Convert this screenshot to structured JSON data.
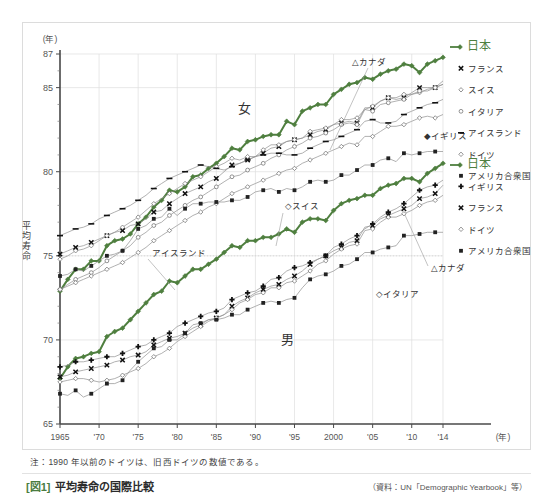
{
  "top_cut_text": "",
  "figure": {
    "caption_tag": "[図1]",
    "caption_title": "平均寿命の国際比較",
    "source": "（資料：UN「Demographic Yearbook」等）",
    "note": "注：1990 年以前のドイツは、旧西ドイツの数値である。"
  },
  "colors": {
    "japan_green": "#4f7f3f",
    "line_gray": "#8a8a8a",
    "axis": "#555555",
    "grid": "#dedede"
  },
  "chart_data": {
    "type": "line",
    "title": "平均寿命の国際比較",
    "xlabel": "(年)",
    "ylabel": "平均寿命",
    "yunit": "(年)",
    "xlim": [
      1965,
      2014
    ],
    "ylim": [
      65,
      87
    ],
    "yticks": [
      65,
      70,
      75,
      80,
      85,
      87
    ],
    "ytick_labels": [
      "65",
      "70",
      "75",
      "80",
      "85",
      "87"
    ],
    "xticks": [
      1965,
      1970,
      1975,
      1980,
      1985,
      1990,
      1995,
      2000,
      2005,
      2010,
      2014
    ],
    "xtick_labels": [
      "1965",
      "'70",
      "'75",
      "'80",
      "'85",
      "'90",
      "'95",
      "2000",
      "'05",
      "'10",
      "'14"
    ],
    "grid": true,
    "legend_position": "right",
    "group_labels": {
      "female": "女",
      "male": "男"
    },
    "inline_annotations": [
      {
        "text": "△カナダ",
        "x": 1994,
        "y": 86.2,
        "group": "female"
      },
      {
        "text": "◇スイス",
        "x": 1989,
        "y": 80.6,
        "group": "female"
      },
      {
        "text": "アイスランド",
        "x": 1977,
        "y": 77.0,
        "group": "female"
      },
      {
        "text": "◆イギリス",
        "x": 2008,
        "y": 81.6,
        "group": "male"
      },
      {
        "text": "△カナダ",
        "x": 2009,
        "y": 74.2,
        "group": "male"
      },
      {
        "text": "◇イタリア",
        "x": 2003,
        "y": 72.9,
        "group": "male"
      }
    ],
    "legend_female": [
      {
        "label": "日本",
        "marker": "diamond",
        "color": "#4f7f3f",
        "emphasis": true
      },
      {
        "label": "フランス",
        "marker": "cross-bold",
        "color": "#222222"
      },
      {
        "label": "スイス",
        "marker": "diamond-open-small",
        "color": "#555555"
      },
      {
        "label": "イタリア",
        "marker": "circle-open",
        "color": "#555555"
      },
      {
        "label": "アイスランド",
        "marker": "dash",
        "color": "#222222"
      },
      {
        "label": "ドイツ",
        "marker": "diamond-open",
        "color": "#555555"
      },
      {
        "label": "アメリカ合衆国",
        "marker": "square",
        "color": "#222222"
      }
    ],
    "legend_male": [
      {
        "label": "日本",
        "marker": "diamond",
        "color": "#4f7f3f",
        "emphasis": true
      },
      {
        "label": "イギリス",
        "marker": "plus-bold",
        "color": "#222222"
      },
      {
        "label": "フランス",
        "marker": "cross-bold",
        "color": "#222222"
      },
      {
        "label": "ドイツ",
        "marker": "diamond-open",
        "color": "#555555"
      },
      {
        "label": "アメリカ合衆国",
        "marker": "square",
        "color": "#222222"
      }
    ],
    "x": [
      1965,
      1966,
      1967,
      1968,
      1969,
      1970,
      1971,
      1972,
      1973,
      1974,
      1975,
      1976,
      1977,
      1978,
      1979,
      1980,
      1981,
      1982,
      1983,
      1984,
      1985,
      1986,
      1987,
      1988,
      1989,
      1990,
      1991,
      1992,
      1993,
      1994,
      1995,
      1996,
      1997,
      1998,
      1999,
      2000,
      2001,
      2002,
      2003,
      2004,
      2005,
      2006,
      2007,
      2008,
      2009,
      2010,
      2011,
      2012,
      2013,
      2014
    ],
    "series": [
      {
        "name": "日本",
        "group": "female",
        "color": "#4f7f3f",
        "values": [
          72.9,
          73.6,
          74.2,
          74.2,
          74.7,
          74.7,
          75.6,
          75.9,
          76.0,
          76.3,
          76.9,
          77.3,
          77.9,
          78.3,
          78.9,
          78.8,
          79.1,
          79.7,
          79.8,
          80.2,
          80.5,
          80.9,
          81.4,
          81.3,
          81.8,
          81.9,
          82.1,
          82.2,
          82.2,
          83.0,
          82.8,
          83.6,
          83.8,
          84.0,
          84.0,
          84.6,
          84.9,
          85.2,
          85.3,
          85.6,
          85.5,
          85.8,
          86.0,
          86.1,
          86.4,
          86.3,
          85.9,
          86.4,
          86.6,
          86.8
        ]
      },
      {
        "name": "フランス",
        "group": "female",
        "color": "#222222",
        "values": [
          75.1,
          75.3,
          75.5,
          75.6,
          75.8,
          76.0,
          76.2,
          76.4,
          76.5,
          76.8,
          76.9,
          77.2,
          77.6,
          77.7,
          78.1,
          78.4,
          78.7,
          78.9,
          79.1,
          79.4,
          79.6,
          80.0,
          80.4,
          80.5,
          80.7,
          80.9,
          81.1,
          81.4,
          81.5,
          81.8,
          81.9,
          82.0,
          82.2,
          82.4,
          82.5,
          82.8,
          82.9,
          83.0,
          82.9,
          83.8,
          83.8,
          84.2,
          84.4,
          84.3,
          84.4,
          84.7,
          85.0,
          85.0,
          85.0,
          85.4
        ]
      },
      {
        "name": "スイス",
        "group": "female",
        "color": "#555555",
        "values": [
          74.8,
          75.0,
          75.3,
          75.4,
          75.6,
          75.9,
          76.2,
          76.4,
          76.7,
          77.0,
          77.3,
          77.7,
          78.1,
          78.4,
          78.7,
          79.0,
          79.3,
          79.5,
          79.7,
          80.0,
          80.3,
          80.5,
          80.8,
          80.7,
          80.9,
          80.9,
          81.3,
          81.6,
          81.6,
          81.8,
          81.9,
          82.0,
          82.4,
          82.5,
          82.6,
          82.8,
          83.1,
          83.1,
          83.2,
          83.7,
          83.9,
          84.2,
          84.4,
          84.4,
          84.6,
          84.6,
          84.7,
          84.9,
          85.0,
          85.2
        ]
      },
      {
        "name": "イタリア",
        "group": "female",
        "color": "#555555",
        "values": [
          73.0,
          73.3,
          73.6,
          73.8,
          74.0,
          74.3,
          74.7,
          75.0,
          75.3,
          75.6,
          76.1,
          76.4,
          76.8,
          77.0,
          77.4,
          77.7,
          78.0,
          78.3,
          78.5,
          78.8,
          79.1,
          79.4,
          79.7,
          79.8,
          80.1,
          80.3,
          80.5,
          80.8,
          81.0,
          81.3,
          81.5,
          81.7,
          82.0,
          82.1,
          82.3,
          82.5,
          82.8,
          82.9,
          82.8,
          83.7,
          83.6,
          84.0,
          84.1,
          84.2,
          84.3,
          84.6,
          84.8,
          84.8,
          85.0,
          85.2
        ]
      },
      {
        "name": "アイスランド",
        "group": "female",
        "color": "#222222",
        "values": [
          76.2,
          76.4,
          76.6,
          76.7,
          76.9,
          77.2,
          77.4,
          77.6,
          77.8,
          78.0,
          78.3,
          78.6,
          79.0,
          79.3,
          79.6,
          79.8,
          80.0,
          80.2,
          80.4,
          80.3,
          80.2,
          80.1,
          80.3,
          80.5,
          80.7,
          80.9,
          81.0,
          81.1,
          81.1,
          81.0,
          81.0,
          81.1,
          81.4,
          81.6,
          81.8,
          81.9,
          82.1,
          82.3,
          82.5,
          83.0,
          83.1,
          82.9,
          82.9,
          83.0,
          83.4,
          83.6,
          83.8,
          84.0,
          84.1,
          84.3
        ]
      },
      {
        "name": "ドイツ",
        "group": "female",
        "color": "#555555",
        "values": [
          73.0,
          73.2,
          73.4,
          73.6,
          73.8,
          74.0,
          74.2,
          74.4,
          74.6,
          74.9,
          75.2,
          75.5,
          75.9,
          76.2,
          76.5,
          76.8,
          77.1,
          77.4,
          77.6,
          77.9,
          78.1,
          78.4,
          78.7,
          78.9,
          79.1,
          79.3,
          79.5,
          79.7,
          79.9,
          80.1,
          80.2,
          80.5,
          80.7,
          80.9,
          81.1,
          81.3,
          81.5,
          81.7,
          81.6,
          82.1,
          82.1,
          82.4,
          82.7,
          82.7,
          82.8,
          83.0,
          83.2,
          83.3,
          83.2,
          83.4
        ]
      },
      {
        "name": "アメリカ合衆国",
        "group": "female",
        "color": "#222222",
        "values": [
          73.8,
          73.9,
          74.2,
          74.1,
          74.4,
          74.7,
          75.0,
          75.1,
          75.3,
          75.9,
          76.6,
          76.8,
          77.2,
          77.3,
          77.8,
          77.4,
          77.8,
          78.1,
          78.1,
          78.2,
          78.2,
          78.2,
          78.3,
          78.3,
          78.5,
          78.8,
          78.9,
          79.0,
          78.8,
          79.0,
          78.9,
          79.1,
          79.4,
          79.5,
          79.4,
          79.5,
          79.8,
          79.8,
          80.1,
          80.4,
          80.4,
          80.7,
          80.8,
          80.6,
          81.1,
          81.0,
          81.1,
          81.2,
          81.2,
          81.2
        ]
      },
      {
        "name": "日本",
        "group": "male",
        "color": "#4f7f3f",
        "values": [
          67.7,
          68.4,
          68.9,
          69.0,
          69.2,
          69.3,
          70.2,
          70.5,
          70.7,
          71.2,
          71.7,
          72.2,
          72.7,
          72.9,
          73.5,
          73.4,
          73.8,
          74.2,
          74.2,
          74.5,
          74.8,
          75.2,
          75.6,
          75.5,
          75.9,
          75.9,
          76.1,
          76.1,
          76.3,
          76.6,
          76.4,
          77.0,
          77.2,
          77.2,
          77.1,
          77.7,
          78.1,
          78.3,
          78.4,
          78.6,
          78.6,
          79.0,
          79.2,
          79.3,
          79.6,
          79.6,
          79.4,
          79.9,
          80.2,
          80.5
        ]
      },
      {
        "name": "イギリス",
        "group": "male",
        "color": "#222222",
        "values": [
          68.4,
          68.5,
          68.7,
          68.7,
          68.8,
          68.9,
          69.0,
          69.0,
          69.2,
          69.4,
          69.6,
          69.7,
          70.0,
          70.2,
          70.4,
          70.8,
          71.0,
          71.2,
          71.4,
          71.6,
          71.7,
          71.9,
          72.4,
          72.6,
          72.8,
          72.9,
          73.2,
          73.6,
          73.7,
          74.1,
          74.3,
          74.4,
          74.6,
          74.8,
          75.0,
          75.5,
          75.7,
          76.0,
          76.2,
          76.6,
          76.9,
          77.3,
          77.6,
          77.8,
          78.1,
          78.5,
          78.9,
          79.1,
          79.2,
          79.5
        ]
      },
      {
        "name": "フランス",
        "group": "male",
        "color": "#222222",
        "values": [
          67.8,
          67.9,
          68.1,
          68.2,
          68.3,
          68.4,
          68.5,
          68.7,
          68.8,
          69.0,
          69.1,
          69.3,
          69.7,
          69.9,
          70.1,
          70.2,
          70.4,
          70.7,
          70.9,
          71.2,
          71.3,
          71.5,
          72.0,
          72.3,
          72.5,
          72.8,
          73.0,
          73.2,
          73.3,
          73.6,
          73.8,
          74.1,
          74.5,
          74.8,
          75.0,
          75.3,
          75.5,
          75.8,
          75.9,
          76.7,
          76.8,
          77.2,
          77.4,
          77.6,
          77.8,
          78.0,
          78.4,
          78.5,
          78.7,
          79.2
        ]
      },
      {
        "name": "ドイツ",
        "group": "male",
        "color": "#555555",
        "values": [
          67.5,
          67.6,
          67.7,
          67.7,
          67.6,
          67.5,
          67.6,
          67.7,
          67.9,
          68.1,
          68.3,
          68.6,
          69.0,
          69.2,
          69.5,
          69.9,
          70.2,
          70.5,
          70.8,
          71.1,
          71.3,
          71.5,
          71.8,
          72.2,
          72.4,
          72.7,
          72.8,
          73.1,
          73.1,
          73.4,
          73.5,
          73.8,
          74.1,
          74.5,
          74.7,
          75.1,
          75.4,
          75.6,
          75.7,
          76.5,
          76.6,
          77.0,
          77.3,
          77.3,
          77.5,
          77.7,
          78.0,
          78.2,
          78.3,
          78.6
        ]
      },
      {
        "name": "アメリカ合衆国",
        "group": "male",
        "color": "#222222",
        "values": [
          66.8,
          66.7,
          67.0,
          66.6,
          66.8,
          67.1,
          67.4,
          67.4,
          67.6,
          68.2,
          68.7,
          69.1,
          69.5,
          69.6,
          70.0,
          70.0,
          70.4,
          70.9,
          71.0,
          71.2,
          71.2,
          71.3,
          71.5,
          71.5,
          71.8,
          72.0,
          72.2,
          72.3,
          72.2,
          72.4,
          72.5,
          73.1,
          73.6,
          73.8,
          73.9,
          74.1,
          74.4,
          74.5,
          74.8,
          75.2,
          75.2,
          75.4,
          75.5,
          75.6,
          76.2,
          76.2,
          76.3,
          76.4,
          76.4,
          76.4
        ]
      }
    ]
  }
}
